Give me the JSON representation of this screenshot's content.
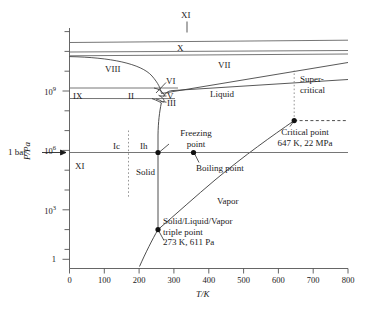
{
  "figure": {
    "kind": "phase-diagram",
    "substance": "water",
    "colors": {
      "line": "#555555",
      "curve": "#3a3a3a",
      "text": "#1a1a1a",
      "dash": "#777777"
    }
  },
  "axes": {
    "x": {
      "title": "T/K",
      "min": 0,
      "max": 800,
      "ticks": [
        0,
        100,
        200,
        300,
        400,
        500,
        600,
        700,
        800
      ],
      "tick_labels": [
        "0",
        "100",
        "200",
        "300",
        "400",
        "500",
        "600",
        "700",
        "800"
      ]
    },
    "y": {
      "title": "P/Pa",
      "scale": "log",
      "min_exp": -0.7,
      "max_exp": 11.2,
      "major_labels": [
        {
          "text": "10",
          "sup": "9",
          "exp": 9
        },
        {
          "text": "10",
          "sup": "6",
          "exp": 6
        },
        {
          "text": "10",
          "sup": "3",
          "exp": 3
        },
        {
          "text": "1",
          "sup": "",
          "exp": 0
        }
      ],
      "minor_exps": [
        11,
        10,
        8,
        7,
        5,
        4,
        2,
        1
      ]
    }
  },
  "annotations": {
    "one_bar": "1 bar"
  },
  "regions": [
    {
      "name": "ice-XI-top",
      "label": "XI",
      "x": 323,
      "y": 11.0
    },
    {
      "name": "ice-X",
      "label": "X",
      "x": 318,
      "y": 9.95
    },
    {
      "name": "ice-VIII",
      "label": "VIII",
      "x": 152,
      "y": 9.62
    },
    {
      "name": "ice-VI",
      "label": "VI",
      "x": 290,
      "y": 9.45
    },
    {
      "name": "ice-VII",
      "label": "VII",
      "x": 445,
      "y": 9.72
    },
    {
      "name": "ice-IX",
      "label": "IX",
      "x": 42,
      "y": 8.72
    },
    {
      "name": "ice-II",
      "label": "II",
      "x": 215,
      "y": 8.74
    },
    {
      "name": "ice-V",
      "label": "V",
      "x": 310,
      "y": 8.86
    },
    {
      "name": "ice-III",
      "label": "III",
      "x": 315,
      "y": 8.48
    },
    {
      "name": "liquid",
      "label": "Liquid",
      "x": 500,
      "y": 8.6
    },
    {
      "name": "ice-Ic",
      "label": "Ic",
      "x": 128,
      "y": 5.7
    },
    {
      "name": "ice-Ih",
      "label": "Ih",
      "x": 235,
      "y": 5.7
    },
    {
      "name": "solid",
      "label": "Solid",
      "x": 235,
      "y": 4.45
    },
    {
      "name": "ice-XI-bottom",
      "label": "XI",
      "x": 60,
      "y": 4.45
    },
    {
      "name": "vapor",
      "label": "Vapor",
      "x": 455,
      "y": 3.0
    }
  ],
  "callouts": {
    "supercritical": {
      "line1": "Super-",
      "line2": "critical"
    },
    "freezing_point": {
      "line1": "Freezing",
      "line2": "point"
    },
    "boiling_point": {
      "line1": "Boiling point"
    },
    "critical_point": {
      "line1": "Critical point",
      "line2": "647 K, 22 MPa"
    },
    "triple_point": {
      "line1": "Solid/Liquid/Vapor",
      "line2": "triple point",
      "line3": "273 K, 611 Pa"
    }
  },
  "points": [
    {
      "name": "freezing-point-marker",
      "T": 273,
      "exp": 5.0
    },
    {
      "name": "boiling-point-marker",
      "T": 373,
      "exp": 5.0
    },
    {
      "name": "triple-point-marker",
      "T": 273,
      "exp": 2.786
    },
    {
      "name": "critical-point-marker",
      "T": 647,
      "exp": 7.342
    }
  ]
}
